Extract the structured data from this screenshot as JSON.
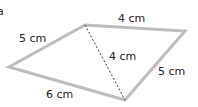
{
  "diagram": {
    "part_label": "a",
    "shape": "quadrilateral split by diagonal into two triangles",
    "stroke_color": "#bdbdbd",
    "diagonal_style": "dashed",
    "labels": {
      "top_edge": "4 cm",
      "left_edge": "5 cm",
      "right_edge": "5 cm",
      "bottom_edge": "6 cm",
      "diagonal": "4 cm"
    }
  }
}
